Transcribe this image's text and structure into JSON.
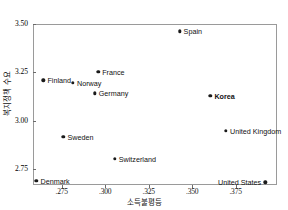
{
  "chart_data": {
    "type": "scatter",
    "title": "",
    "xlabel": "소득불평등",
    "ylabel": "복지정책 수요",
    "xlim": [
      0.2585,
      0.3988
    ],
    "ylim": [
      2.6665,
      3.5
    ],
    "xticks": [
      ".275",
      ".300",
      ".325",
      ".350",
      ".375"
    ],
    "xtick_values": [
      0.275,
      0.3,
      0.325,
      0.35,
      0.375
    ],
    "yticks": [
      "3.50",
      "3.25",
      "3.00",
      "2.75"
    ],
    "ytick_values": [
      3.5,
      3.25,
      3.0,
      2.75
    ],
    "grid": false,
    "legend": false,
    "marker_color": "#1a1a1a",
    "frame_color": "#9a9a9a",
    "points": [
      {
        "label": "Spain",
        "x": 0.3428,
        "y": 3.462,
        "label_side": "right",
        "emphasis": false
      },
      {
        "label": "France",
        "x": 0.296,
        "y": 3.254,
        "label_side": "right",
        "emphasis": false
      },
      {
        "label": "Finland",
        "x": 0.2645,
        "y": 3.208,
        "label_side": "right",
        "emphasis": false
      },
      {
        "label": "Norway",
        "x": 0.2815,
        "y": 3.1965,
        "label_side": "right",
        "emphasis": false
      },
      {
        "label": "Germany",
        "x": 0.294,
        "y": 3.141,
        "label_side": "right",
        "emphasis": false
      },
      {
        "label": "Korea",
        "x": 0.3605,
        "y": 3.128,
        "label_side": "right",
        "emphasis": true
      },
      {
        "label": "United Kingdom",
        "x": 0.3695,
        "y": 2.948,
        "label_side": "right",
        "emphasis": false
      },
      {
        "label": "Sweden",
        "x": 0.276,
        "y": 2.9155,
        "label_side": "right",
        "emphasis": false
      },
      {
        "label": "Switzerland",
        "x": 0.3055,
        "y": 2.801,
        "label_side": "right",
        "emphasis": false
      },
      {
        "label": "Denmark",
        "x": 0.2605,
        "y": 2.688,
        "label_side": "right",
        "emphasis": false
      },
      {
        "label": "United States",
        "x": 0.392,
        "y": 2.681,
        "label_side": "left",
        "emphasis": false
      }
    ]
  }
}
